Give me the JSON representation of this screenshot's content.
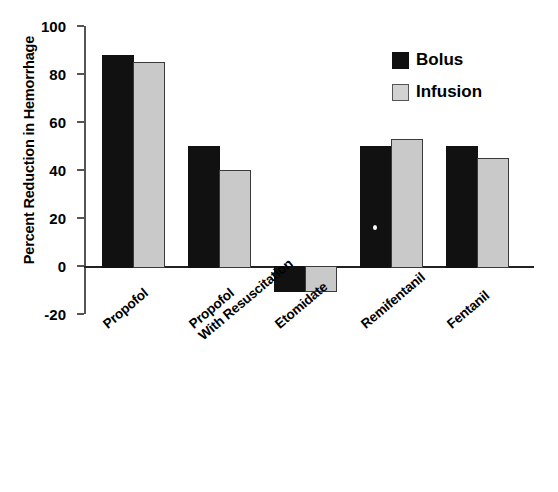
{
  "chart_data": {
    "type": "bar",
    "title": "",
    "xlabel": "",
    "ylabel": "Percent Reduction in Hemorrhage",
    "ylim": [
      -20,
      100
    ],
    "yticks": [
      -20,
      0,
      20,
      40,
      60,
      80,
      100
    ],
    "ytick_labels": [
      "-20",
      "0",
      "20",
      "40",
      "60",
      "80",
      "100"
    ],
    "grid": false,
    "legend_position": "top-right",
    "categories": [
      "Propofol",
      "Propofol With Resuscitation",
      "Etomidate",
      "Remifentanil",
      "Fentanil"
    ],
    "category_lines": [
      [
        "Propofol",
        ""
      ],
      [
        "Propofol",
        "With Resuscitation"
      ],
      [
        "Etomidate",
        ""
      ],
      [
        "Remifentanil",
        ""
      ],
      [
        "Fentanil",
        ""
      ]
    ],
    "series": [
      {
        "name": "Bolus",
        "color": "#111111",
        "values": [
          88,
          50,
          -10,
          50,
          50
        ]
      },
      {
        "name": "Infusion",
        "color": "#c9c9c9",
        "values": [
          85,
          40,
          -10,
          53,
          45
        ]
      }
    ]
  },
  "legend": {
    "items": [
      {
        "label": "Bolus",
        "swatch": "black-square"
      },
      {
        "label": "Infusion",
        "swatch": "light-gray-square"
      }
    ]
  }
}
